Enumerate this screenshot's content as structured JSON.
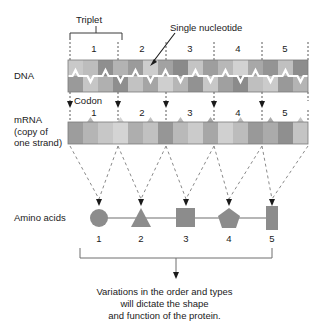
{
  "figure": {
    "type": "biology-diagram",
    "topic": "DNA to mRNA to amino acid sequence (transcription and translation)"
  },
  "labels": {
    "triplet": "Triplet",
    "single_nucleotide": "Single nucleotide",
    "codon": "Codon",
    "dna": "DNA",
    "mrna_line1": "mRNA",
    "mrna_line2": "(copy of",
    "mrna_line3": "one strand)",
    "amino_acids": "Amino acids"
  },
  "caption": {
    "line1": "Variations in the order and types",
    "line2": "will dictate the shape",
    "line3": "and function of the protein."
  },
  "numbering": {
    "dna_row": [
      "1",
      "2",
      "3",
      "4",
      "5"
    ],
    "mrna_row": [
      "1",
      "2",
      "3",
      "4",
      "5"
    ],
    "amino_row": [
      "1",
      "2",
      "3",
      "4",
      "5"
    ]
  },
  "dna": {
    "nucleotide_count": 16,
    "top_strand_shades": [
      "#c9c9c9",
      "#bdbdbd",
      "#8f8f8f",
      "#b3b3b3",
      "#9b9b9b",
      "#cdcdcd",
      "#a2a2a2",
      "#8a8a8a",
      "#c4c4c4",
      "#9e9e9e",
      "#b8b8b8",
      "#d2d2d2",
      "#a8a8a8",
      "#949494",
      "#c0c0c0",
      "#8d8d8d"
    ],
    "bottom_strand_shades": [
      "#9a9a9a",
      "#c6c6c6",
      "#b0b0b0",
      "#8e8e8e",
      "#c2c2c2",
      "#a5a5a5",
      "#cfcfcf",
      "#b6b6b6",
      "#929292",
      "#c8c8c8",
      "#a0a0a0",
      "#8b8b8b",
      "#bfbfbf",
      "#cbcbcb",
      "#999999",
      "#b4b4b4"
    ]
  },
  "mrna": {
    "nucleotide_count": 16,
    "shades": [
      "#9d9d9d",
      "#b5b5b5",
      "#c7c7c7",
      "#d4d4d4",
      "#aeaeae",
      "#c1c1c1",
      "#969696",
      "#b9b9b9",
      "#cbcbcb",
      "#a7a7a7",
      "#d0d0d0",
      "#bcbcbc",
      "#999999",
      "#ababab",
      "#8f8f8f",
      "#c4c4c4"
    ]
  },
  "amino_acids": [
    {
      "index": "1",
      "shape": "circle"
    },
    {
      "index": "2",
      "shape": "triangle"
    },
    {
      "index": "3",
      "shape": "square"
    },
    {
      "index": "4",
      "shape": "pentagon"
    },
    {
      "index": "5",
      "shape": "rectangle"
    }
  ],
  "colors": {
    "amino_shape_fill": "#8c8c8c",
    "line": "#6f6f6f",
    "dashed": "#8a8a8a",
    "text": "#1a1a1a",
    "strand_center": "#ffffff"
  }
}
